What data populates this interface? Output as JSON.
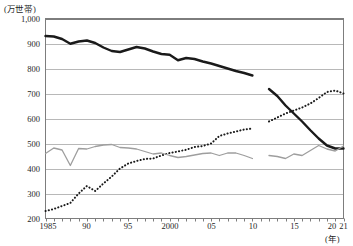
{
  "axes": {
    "unit_label": "(万世帯)",
    "x_axis_label": "(年)",
    "y_ticks": [
      "1,000",
      "900",
      "800",
      "700",
      "600",
      "500",
      "400",
      "300",
      "200"
    ],
    "x_ticks": [
      "1985",
      "90",
      "95",
      "2000",
      "05",
      "10",
      "15",
      "20",
      "21"
    ]
  },
  "colors": {
    "series_black": "#1a1a1a",
    "series_dotted": "#1a1a1a",
    "series_gray": "#9e9e9e",
    "gridline": "#b8b8b8",
    "axis": "#7d7d7d",
    "background": "#ffffff"
  },
  "chart_data": {
    "type": "line",
    "title": "",
    "xlabel": "(年)",
    "ylabel": "(万世帯)",
    "xlim": [
      1985,
      2021
    ],
    "ylim": [
      200,
      1000
    ],
    "ytick_values": [
      1000,
      900,
      800,
      700,
      600,
      500,
      400,
      300,
      200
    ],
    "xtick_values": [
      1985,
      1990,
      1995,
      2000,
      2005,
      2010,
      2015,
      2020,
      2021
    ],
    "grid": "horizontal",
    "legend": "none",
    "note": "Series are broken between 2010 and 2012 (no data plotted for 2011).",
    "x": [
      1985,
      1986,
      1987,
      1988,
      1989,
      1990,
      1991,
      1992,
      1993,
      1994,
      1995,
      1996,
      1997,
      1998,
      1999,
      2000,
      2001,
      2002,
      2003,
      2004,
      2005,
      2006,
      2007,
      2008,
      2009,
      2010,
      2012,
      2013,
      2014,
      2015,
      2016,
      2017,
      2018,
      2019,
      2020,
      2021
    ],
    "series": [
      {
        "name": "thick-black-line",
        "style": "solid-thick",
        "values": [
          930,
          928,
          918,
          899,
          908,
          912,
          902,
          884,
          870,
          866,
          876,
          886,
          880,
          868,
          858,
          855,
          833,
          842,
          838,
          828,
          820,
          810,
          800,
          790,
          782,
          772,
          null,
          null,
          null,
          null,
          null,
          null,
          null,
          null,
          null,
          null
        ]
      },
      {
        "name": "thick-black-line-after-break",
        "style": "solid-thick",
        "values": [
          null,
          null,
          null,
          null,
          null,
          null,
          null,
          null,
          null,
          null,
          null,
          null,
          null,
          null,
          null,
          null,
          null,
          null,
          null,
          null,
          null,
          null,
          null,
          null,
          null,
          null,
          718,
          690,
          652,
          620,
          588,
          553,
          520,
          492,
          480,
          480
        ]
      },
      {
        "name": "dotted-line",
        "style": "dotted",
        "values": [
          230,
          238,
          250,
          262,
          300,
          330,
          310,
          340,
          368,
          400,
          420,
          430,
          438,
          440,
          452,
          462,
          468,
          475,
          486,
          490,
          500,
          530,
          540,
          548,
          556,
          560,
          null,
          null,
          null,
          null,
          null,
          null,
          null,
          null,
          null,
          null
        ]
      },
      {
        "name": "dotted-line-after-break",
        "style": "dotted",
        "values": [
          null,
          null,
          null,
          null,
          null,
          null,
          null,
          null,
          null,
          null,
          null,
          null,
          null,
          null,
          null,
          null,
          null,
          null,
          null,
          null,
          null,
          null,
          null,
          null,
          null,
          null,
          588,
          604,
          620,
          632,
          644,
          660,
          682,
          706,
          712,
          700
        ]
      },
      {
        "name": "gray-line",
        "style": "solid-thin",
        "values": [
          460,
          482,
          474,
          412,
          480,
          478,
          488,
          494,
          496,
          484,
          482,
          478,
          468,
          458,
          462,
          452,
          444,
          448,
          454,
          460,
          462,
          452,
          462,
          462,
          452,
          440,
          null,
          null,
          null,
          null,
          null,
          null,
          null,
          null,
          null,
          null
        ]
      },
      {
        "name": "gray-line-after-break",
        "style": "solid-thin",
        "values": [
          null,
          null,
          null,
          null,
          null,
          null,
          null,
          null,
          null,
          null,
          null,
          null,
          null,
          null,
          null,
          null,
          null,
          null,
          null,
          null,
          null,
          null,
          null,
          null,
          null,
          null,
          452,
          448,
          440,
          458,
          452,
          472,
          492,
          478,
          470,
          490
        ]
      }
    ]
  }
}
